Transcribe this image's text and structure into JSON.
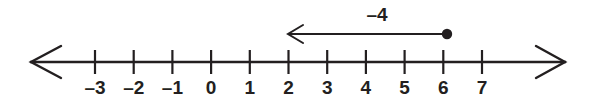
{
  "diagram": {
    "type": "number-line",
    "background_color": "#ffffff",
    "ink_color": "#231f20",
    "axis": {
      "orientation": "horizontal",
      "y": 62,
      "left_arrow_tip_x": 30,
      "right_arrow_tip_x": 566,
      "double_headed": true,
      "tick_spacing_px": 38.7,
      "origin_x": 211,
      "tick_half_height": 12
    },
    "ticks": [
      {
        "value": -3,
        "label": "–3",
        "x": 95
      },
      {
        "value": -2,
        "label": "–2",
        "x": 133.7
      },
      {
        "value": -1,
        "label": "–1",
        "x": 172.4
      },
      {
        "value": 0,
        "label": "0",
        "x": 211.1
      },
      {
        "value": 1,
        "label": "1",
        "x": 249.8
      },
      {
        "value": 2,
        "label": "2",
        "x": 288.5
      },
      {
        "value": 3,
        "label": "3",
        "x": 327.2
      },
      {
        "value": 4,
        "label": "4",
        "x": 365.9
      },
      {
        "value": 5,
        "label": "5",
        "x": 404.6
      },
      {
        "value": 6,
        "label": "6",
        "x": 443.3
      },
      {
        "value": 7,
        "label": "7",
        "x": 482.0
      }
    ],
    "label_baseline_y": 94,
    "point": {
      "label": "start point at 6",
      "value": 6,
      "x": 447,
      "y": 34,
      "radius": 5.2,
      "filled": true
    },
    "jump_arrow": {
      "label": "–4",
      "value": -4,
      "from_value": 6,
      "to_value": 2,
      "from_x": 447,
      "to_x": 287,
      "y": 34,
      "direction": "left",
      "label_x": 377,
      "label_baseline_y": 21
    }
  }
}
